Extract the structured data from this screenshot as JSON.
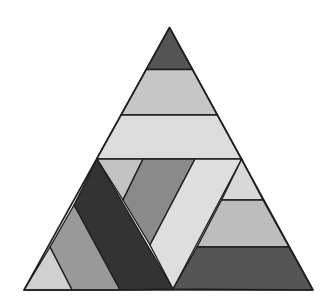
{
  "figure": {
    "type": "dissected-triangle",
    "width": 335,
    "height": 305,
    "background": "#ffffff",
    "stroke": "#1e1e1e",
    "outline": {
      "points": "169.5,27.5 24,290 313,290"
    },
    "pieces": [
      {
        "id": "top-triangle",
        "shade": "#555555",
        "points": "169.5,27.5 146.2,69.5 192.6,69.5"
      },
      {
        "id": "band-2",
        "shade": "#c6c6c6",
        "points": "146.2,69.5 192.6,69.5 217.5,115 121,115"
      },
      {
        "id": "band-3",
        "shade": "#dcdcdc",
        "points": "121,115 217.5,115 241.7,159 96.6,159"
      },
      {
        "id": "lower-light-small-triangle",
        "shade": "#c2c2c2",
        "points": "97,159 143,159 123,200"
      },
      {
        "id": "lower-medium-dark-piece",
        "shade": "#8a8a8a",
        "points": "143,159 195,159 150,245 123,200"
      },
      {
        "id": "lower-light-parallelogram",
        "shade": "#dedede",
        "points": "195,159 241.7,159 173,289 150,245"
      },
      {
        "id": "lower-dark-band",
        "shade": "#333333",
        "points": "97,159 173,289 120,290 74,205"
      },
      {
        "id": "lower-medium-gray-band",
        "shade": "#999999",
        "points": "74,205 120,290 72,290 50,247"
      },
      {
        "id": "bottom-left-light-triangle",
        "shade": "#d0d0d0",
        "points": "50,247 72,290 24,290"
      },
      {
        "id": "right-small-triangle",
        "shade": "#d8d8d8",
        "points": "241.7,159 263,200 221.5,200"
      },
      {
        "id": "right-medium-band",
        "shade": "#bdbdbd",
        "points": "221.5,200 263,200 289,247 197,247"
      },
      {
        "id": "right-dark-trapezoid",
        "shade": "#555555",
        "points": "197,247 289,247 313,290 173,289"
      }
    ]
  }
}
